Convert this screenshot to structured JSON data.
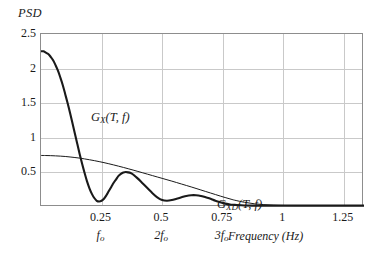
{
  "chart_data": {
    "type": "line",
    "title": "",
    "ylabel": "PSD",
    "xlabel": "Frequency (Hz)",
    "xlim": [
      0,
      1.3333
    ],
    "ylim": [
      0,
      2.5
    ],
    "grid": true,
    "legend_position": "inline-annotation",
    "x_ticks": [
      "0.25",
      "0.5",
      "0.75",
      "1",
      "1.25"
    ],
    "x_tick_values": [
      0.25,
      0.5,
      0.75,
      1,
      1.25
    ],
    "x_subticks": [
      {
        "label": "f",
        "sub": "o",
        "value": 0.25
      },
      {
        "label": "2f",
        "sub": "o",
        "value": 0.5
      },
      {
        "label": "3f",
        "sub": "o",
        "value": 0.75
      }
    ],
    "y_ticks": [
      "2.5",
      "2",
      "1.5",
      "1",
      "0.5"
    ],
    "y_tick_values": [
      2.5,
      2,
      1.5,
      1,
      0.5
    ],
    "annotations": [
      {
        "name": "gx-label",
        "text": "G",
        "sub": "X",
        "args": "(T, f)",
        "x": 0.05,
        "y": 1.72
      },
      {
        "name": "gxd-label",
        "text": "G",
        "sub": "XD",
        "args": "(T, f)",
        "x": 0.56,
        "y": 0.44
      }
    ],
    "series": [
      {
        "name": "G_X(T,f)",
        "style": "thick",
        "color": "#1a1a1a",
        "linewidth": 2.1,
        "x": [
          0,
          0.01,
          0.02,
          0.03,
          0.04,
          0.05,
          0.06,
          0.07,
          0.08,
          0.09,
          0.1,
          0.11,
          0.12,
          0.13,
          0.14,
          0.15,
          0.16,
          0.17,
          0.18,
          0.19,
          0.2,
          0.21,
          0.22,
          0.23,
          0.24,
          0.25,
          0.26,
          0.27,
          0.28,
          0.29,
          0.3,
          0.31,
          0.32,
          0.33,
          0.34,
          0.35,
          0.36,
          0.37,
          0.38,
          0.39,
          0.4,
          0.42,
          0.44,
          0.46,
          0.48,
          0.5,
          0.52,
          0.54,
          0.56,
          0.58,
          0.6,
          0.62,
          0.64,
          0.66,
          0.68,
          0.7,
          0.72,
          0.74,
          0.76,
          0.78,
          0.8,
          0.84,
          0.88,
          0.92,
          0.96,
          1.0,
          1.05,
          1.1,
          1.15,
          1.2,
          1.25,
          1.3,
          1.3333
        ],
        "y": [
          2.25,
          2.25,
          2.23,
          2.21,
          2.17,
          2.12,
          2.05,
          1.97,
          1.87,
          1.76,
          1.63,
          1.5,
          1.36,
          1.21,
          1.06,
          0.91,
          0.76,
          0.62,
          0.49,
          0.37,
          0.27,
          0.19,
          0.13,
          0.09,
          0.08,
          0.09,
          0.12,
          0.17,
          0.23,
          0.29,
          0.35,
          0.4,
          0.45,
          0.48,
          0.5,
          0.505,
          0.5,
          0.49,
          0.47,
          0.44,
          0.41,
          0.34,
          0.27,
          0.2,
          0.14,
          0.1,
          0.09,
          0.1,
          0.12,
          0.14,
          0.16,
          0.17,
          0.17,
          0.16,
          0.14,
          0.12,
          0.09,
          0.07,
          0.05,
          0.035,
          0.03,
          0.022,
          0.02,
          0.02,
          0.02,
          0.02,
          0.02,
          0.02,
          0.02,
          0.02,
          0.02,
          0.02,
          0.02
        ]
      },
      {
        "name": "G_XD(T,f)",
        "style": "thin",
        "color": "#1a1a1a",
        "linewidth": 1.0,
        "x": [
          0,
          0.02,
          0.04,
          0.06,
          0.08,
          0.1,
          0.12,
          0.14,
          0.16,
          0.18,
          0.2,
          0.22,
          0.24,
          0.26,
          0.28,
          0.3,
          0.32,
          0.34,
          0.36,
          0.38,
          0.4,
          0.42,
          0.44,
          0.46,
          0.48,
          0.5,
          0.52,
          0.54,
          0.56,
          0.58,
          0.6,
          0.62,
          0.64,
          0.66,
          0.68,
          0.7,
          0.72,
          0.74,
          0.76,
          0.78,
          0.8,
          0.84,
          0.88,
          0.92,
          0.96,
          1.0,
          1.05,
          1.1,
          1.15,
          1.2,
          1.25,
          1.3,
          1.3333
        ],
        "y": [
          0.745,
          0.744,
          0.742,
          0.739,
          0.735,
          0.73,
          0.723,
          0.715,
          0.706,
          0.695,
          0.683,
          0.67,
          0.656,
          0.641,
          0.625,
          0.608,
          0.59,
          0.572,
          0.553,
          0.534,
          0.514,
          0.494,
          0.474,
          0.454,
          0.434,
          0.414,
          0.394,
          0.374,
          0.353,
          0.332,
          0.311,
          0.29,
          0.268,
          0.246,
          0.224,
          0.202,
          0.18,
          0.158,
          0.137,
          0.117,
          0.098,
          0.068,
          0.047,
          0.034,
          0.026,
          0.022,
          0.02,
          0.02,
          0.02,
          0.02,
          0.02,
          0.02,
          0.02
        ]
      }
    ]
  },
  "colors": {
    "frame": "#8d8d8d",
    "grid": "#c9c9c9",
    "curve": "#1a1a1a",
    "background": "#ffffff"
  }
}
